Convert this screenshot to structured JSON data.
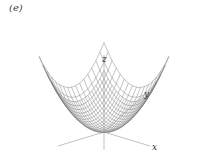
{
  "figure": {
    "panel_label": "(e)",
    "surface": "paraboloid z = x^2 + y^2 wireframe",
    "axes": {
      "x_label": "x",
      "y_label": "y",
      "z_label": "z"
    },
    "colors": {
      "mesh": "#555555",
      "axis": "#888888",
      "background": "#ffffff"
    }
  }
}
